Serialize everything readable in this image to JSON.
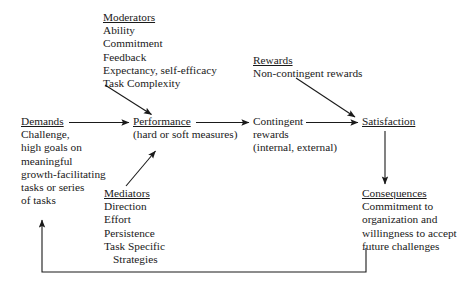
{
  "diagram": {
    "background_color": "#ffffff",
    "line_color": "#1a1a1a",
    "text_color": "#1a1a1a"
  },
  "nodes": {
    "moderators": {
      "header": "Moderators",
      "lines": [
        "Ability",
        "Commitment",
        "Feedback",
        "Expectancy, self-efficacy",
        "Task Complexity"
      ]
    },
    "rewards": {
      "header": "Rewards",
      "lines": [
        "Non-contingent rewards"
      ]
    },
    "demands": {
      "header": "Demands",
      "lines": [
        "Challenge,",
        "high goals on",
        "meaningful",
        "growth-facilitating",
        "tasks or series",
        "of tasks"
      ]
    },
    "performance": {
      "header": "Performance",
      "lines": [
        "(hard or soft measures)"
      ]
    },
    "contingent_rewards": {
      "header": "",
      "lines": [
        "Contingent",
        "rewards",
        "(internal, external)"
      ]
    },
    "satisfaction": {
      "header": "Satisfaction",
      "lines": []
    },
    "mediators": {
      "header": "Mediators",
      "lines": [
        "Direction",
        "Effort",
        "Persistence",
        "Task Specific",
        "Strategies"
      ]
    },
    "consequences": {
      "header": "Consequences",
      "lines": [
        "Commitment to",
        "organization and",
        "willingness to accept",
        "future challenges"
      ]
    }
  },
  "edges": [
    {
      "name": "moderators-to-performance",
      "label": ""
    },
    {
      "name": "demands-to-performance",
      "label": ""
    },
    {
      "name": "mediators-to-performance",
      "label": ""
    },
    {
      "name": "performance-to-contingent-rewards",
      "label": ""
    },
    {
      "name": "contingent-rewards-to-satisfaction",
      "label": ""
    },
    {
      "name": "rewards-to-satisfaction",
      "label": ""
    },
    {
      "name": "satisfaction-to-consequences",
      "label": ""
    },
    {
      "name": "consequences-to-demands-feedback-loop",
      "label": ""
    }
  ]
}
